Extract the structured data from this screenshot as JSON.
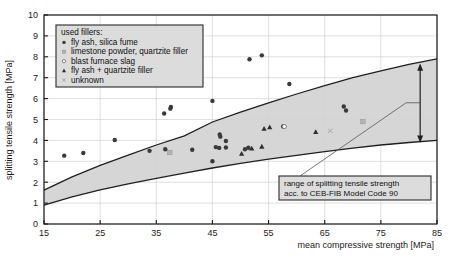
{
  "chart_data": {
    "type": "scatter",
    "title": "",
    "xlabel": "mean compressive strength [MPa]",
    "ylabel": "splitting tensile strength [MPa]",
    "xlim": [
      15,
      85
    ],
    "ylim": [
      0,
      10
    ],
    "xticks": [
      15,
      25,
      35,
      45,
      55,
      65,
      75,
      85
    ],
    "yticks": [
      0,
      1,
      2,
      3,
      4,
      5,
      6,
      7,
      8,
      9,
      10
    ],
    "grid": true,
    "legend_position": "upper-left",
    "legend_title": "used fillers:",
    "series": [
      {
        "name": "fly ash, silica fume",
        "marker": "filled-circle",
        "color": "#3a3a3a",
        "points": [
          [
            18.6,
            3.27
          ],
          [
            22.0,
            3.4
          ],
          [
            27.6,
            4.02
          ],
          [
            33.8,
            3.5
          ],
          [
            36.6,
            3.58
          ],
          [
            36.4,
            5.29
          ],
          [
            37.5,
            5.52
          ],
          [
            37.6,
            5.6
          ],
          [
            41.4,
            3.55
          ],
          [
            45.0,
            5.89
          ],
          [
            45.0,
            3.0
          ],
          [
            45.6,
            3.68
          ],
          [
            46.2,
            3.64
          ],
          [
            46.3,
            4.28
          ],
          [
            46.4,
            4.18
          ],
          [
            47.4,
            3.97
          ],
          [
            47.4,
            3.66
          ],
          [
            50.8,
            3.58
          ],
          [
            51.4,
            3.65
          ],
          [
            51.6,
            7.88
          ],
          [
            53.8,
            8.07
          ],
          [
            57.6,
            4.67
          ],
          [
            58.7,
            6.7
          ],
          [
            68.4,
            5.62
          ],
          [
            68.8,
            5.43
          ]
        ]
      },
      {
        "name": "limestone powder, quartzite filler",
        "marker": "filled-square",
        "color": "#b4b4b4",
        "points": [
          [
            37.4,
            3.42
          ],
          [
            71.8,
            4.9
          ]
        ]
      },
      {
        "name": "blast furnace slag",
        "marker": "open-circle",
        "color": "#ffffff",
        "points": [
          [
            57.8,
            4.66
          ]
        ]
      },
      {
        "name": "fly ash + quartzite filler",
        "marker": "filled-triangle",
        "color": "#2e2e2e",
        "points": [
          [
            50.2,
            3.36
          ],
          [
            52.0,
            3.61
          ],
          [
            53.8,
            3.7
          ],
          [
            54.2,
            4.56
          ],
          [
            55.2,
            4.63
          ],
          [
            63.4,
            4.4
          ]
        ]
      },
      {
        "name": "unknown",
        "marker": "cross",
        "color": "#9a9a9a",
        "points": [
          [
            66.0,
            4.46
          ]
        ]
      }
    ],
    "band": {
      "label": "range of splitting tensile strength acc. to CEB-FIB Model Code 90",
      "upper": [
        [
          15,
          1.62
        ],
        [
          20,
          2.25
        ],
        [
          25,
          2.8
        ],
        [
          30,
          3.3
        ],
        [
          35,
          3.78
        ],
        [
          40,
          4.22
        ],
        [
          45,
          4.88
        ],
        [
          50,
          5.35
        ],
        [
          55,
          5.8
        ],
        [
          60,
          6.22
        ],
        [
          65,
          6.62
        ],
        [
          70,
          7.0
        ],
        [
          75,
          7.33
        ],
        [
          80,
          7.64
        ],
        [
          85,
          7.9
        ]
      ],
      "lower": [
        [
          15,
          0.9
        ],
        [
          20,
          1.3
        ],
        [
          25,
          1.63
        ],
        [
          30,
          1.92
        ],
        [
          35,
          2.18
        ],
        [
          40,
          2.43
        ],
        [
          45,
          2.68
        ],
        [
          50,
          2.9
        ],
        [
          55,
          3.1
        ],
        [
          60,
          3.28
        ],
        [
          65,
          3.46
        ],
        [
          70,
          3.63
        ],
        [
          75,
          3.78
        ],
        [
          80,
          3.9
        ],
        [
          85,
          4.0
        ]
      ],
      "fill_color": "#d2d2d2"
    },
    "annotation": {
      "line1": "range of splitting tensile strength",
      "line2": "acc. to CEB-FIB Model Code 90",
      "arrow_x": 82.0,
      "arrow_y_top": 7.62,
      "arrow_y_bottom": 3.95
    }
  },
  "axes": {
    "x_title": "mean compressive strength [MPa]",
    "y_title": "splitting tensile strength [MPa]",
    "x_tick_labels": [
      "15",
      "25",
      "35",
      "45",
      "55",
      "65",
      "75",
      "85"
    ],
    "y_tick_labels": [
      "0",
      "1",
      "2",
      "3",
      "4",
      "5",
      "6",
      "7",
      "8",
      "9",
      "10"
    ]
  },
  "legend": {
    "title": "used fillers:",
    "items": [
      {
        "label": "fly ash, silica fume",
        "marker": "filled-circle"
      },
      {
        "label": "limestone powder, quartzite filler",
        "marker": "filled-square"
      },
      {
        "label": "blast furnace slag",
        "marker": "open-circle"
      },
      {
        "label": "fly ash + quartzite filler",
        "marker": "filled-triangle"
      },
      {
        "label": "unknown",
        "marker": "cross"
      }
    ]
  },
  "callout": {
    "line1": "range of splitting tensile strength",
    "line2": "acc. to CEB-FIB Model Code 90"
  }
}
